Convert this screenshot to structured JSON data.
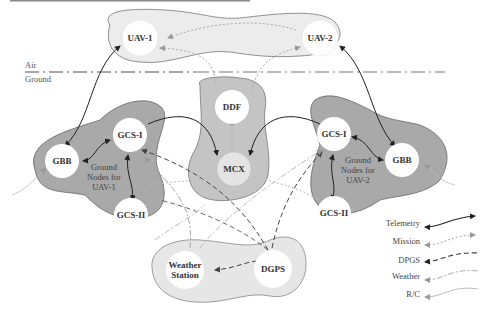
{
  "diagram": {
    "boundary": {
      "air_label": "Air",
      "ground_label": "Ground"
    },
    "nodes": {
      "uav1": "UAV-1",
      "uav2": "UAV-2",
      "ddf": "DDF",
      "mcx": "MCX",
      "gcs1_left": "GCS-I",
      "gcs2_left": "GCS-II",
      "gbb_left": "GBB",
      "gcs1_right": "GCS-I",
      "gcs2_right": "GCS-II",
      "gbb_right": "GBB",
      "weather_station_line1": "Weather",
      "weather_station_line2": "Station",
      "dgps": "DGPS"
    },
    "regions": {
      "left_group": [
        "Ground",
        "Nodes for",
        "UAV-1"
      ],
      "right_group": [
        "Ground",
        "Nodes for",
        "UAV-2"
      ]
    },
    "legend": [
      {
        "label": "Telemetry",
        "style": "solid",
        "color": "#222222"
      },
      {
        "label": "Mission",
        "style": "dotted",
        "color": "#aaaaaa"
      },
      {
        "label": "DPGS",
        "style": "dashed",
        "color": "#444444"
      },
      {
        "label": "Weather",
        "style": "dash-dot",
        "color": "#aaaaaa"
      },
      {
        "label": "R/C",
        "style": "solid-light",
        "color": "#bbbbbb"
      }
    ],
    "colors": {
      "air_region": "#ececec",
      "ground_region_dark": "#a9a9a9",
      "center_region": "#c4c4c4",
      "weather_region": "#e6e6e6",
      "node_fill": "#ffffff",
      "mcx_fill": "#e4e4e4",
      "outline": "#777777"
    }
  }
}
